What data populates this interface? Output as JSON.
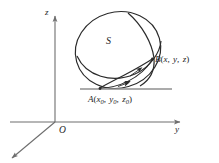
{
  "figure": {
    "type": "3d-sphere-diagram",
    "background_color": "#ffffff",
    "stroke_color": "#2b2b2b",
    "axis_color": "#6e6e6e",
    "tangent_line_color": "#8f8f8f",
    "width": 219,
    "height": 163
  },
  "axes": {
    "z_label": "z",
    "y_label": "y",
    "x_label": "",
    "origin_label": "O"
  },
  "surface": {
    "label": "S",
    "description": "sphere with equator and meridian great-circle arcs"
  },
  "points": {
    "a": {
      "name": "A",
      "open_paren": "(",
      "close_paren": ")",
      "coord_x": "x",
      "coord_x_sub": "0",
      "coord_y": "y",
      "coord_y_sub": "0",
      "coord_z": "z",
      "coord_z_sub": "0",
      "comma": ",",
      "full_label": "A(x0, y0, z0)"
    },
    "b": {
      "name": "B",
      "open_paren": "(",
      "close_paren": ")",
      "coord_x": "x",
      "coord_y": "y",
      "coord_z": "z",
      "comma": ",",
      "full_label": "B(x, y, z)"
    }
  },
  "curve": {
    "description": "directed curve on the sphere from A to B",
    "arrow_count": 2,
    "direction": "A to B"
  }
}
